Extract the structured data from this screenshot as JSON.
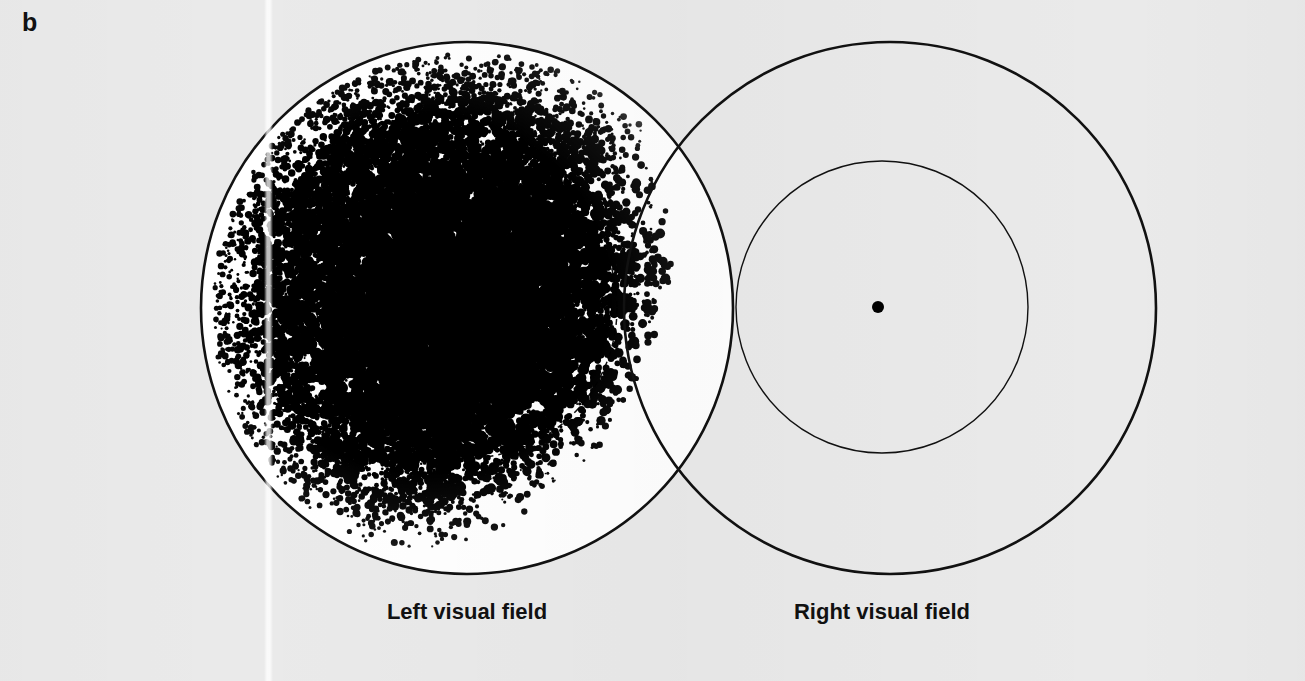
{
  "figure": {
    "panel_label": "b",
    "background_color": "#eaeaea",
    "ink_color": "#111111",
    "field_fill_color": "#ffffff",
    "width": 1305,
    "height": 681
  },
  "captions": {
    "left_field": "Left visual field",
    "right_field": "Right visual field"
  },
  "chart_data": {
    "type": "scatter",
    "title": "b",
    "subtitle": "",
    "xlabel": "",
    "ylabel": "",
    "grid": false,
    "legend_position": "below",
    "xlim": [
      0,
      1305
    ],
    "ylim": [
      0,
      681
    ],
    "series": [
      {
        "name": "Left visual field",
        "label": "Left visual field",
        "marker": "filled-circle",
        "color": "#000000",
        "shape": "circle",
        "center_x": 467,
        "center_y": 308,
        "radius": 266,
        "stipple_density_core": 0.74,
        "stipple_density_edge": 0.2,
        "stipple_point_count": 9000,
        "filled": true,
        "inner_circle": {
          "center_x": 467,
          "center_y": 308,
          "radius": 150,
          "dashed": true,
          "dash_pattern": "6 5"
        }
      },
      {
        "name": "Right visual field",
        "label": "Right visual field",
        "marker": "none",
        "color": "#000000",
        "shape": "circle",
        "center_x": 890,
        "center_y": 308,
        "radius": 266,
        "stipple_density_core": 0,
        "stipple_density_edge": 0,
        "stipple_point_count": 0,
        "filled": false,
        "inner_circle": {
          "center_x": 882,
          "center_y": 307,
          "radius": 146,
          "dashed": false,
          "dash_pattern": ""
        }
      }
    ],
    "annotations": [
      {
        "name": "fixation-dot",
        "label": "",
        "x": 878,
        "y": 307,
        "radius": 6,
        "color": "#000000"
      }
    ]
  }
}
